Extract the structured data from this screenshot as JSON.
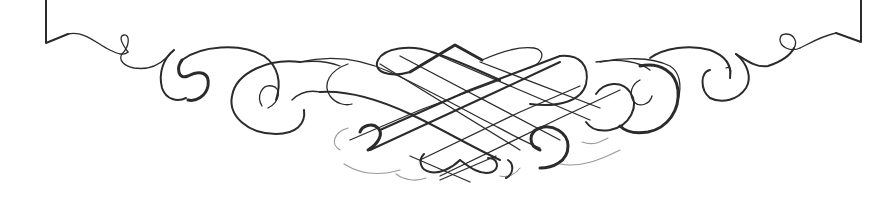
{
  "image": {
    "kind": "calligraphic-flourish-ornament",
    "description": "Decorative pen-flourish frame bottom with interlaced center knot and symmetric scroll curls",
    "colors": {
      "background": "#ffffff",
      "ink": "#2b2b2b",
      "faint_ink": "#9a9a9a"
    },
    "text": []
  }
}
